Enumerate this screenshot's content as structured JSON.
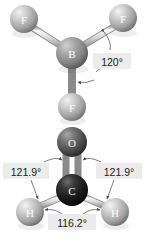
{
  "figure": {
    "background_color": "#ffffff",
    "type": "ball-and-stick molecular geometry diagram"
  },
  "molecules": [
    {
      "name": "boron-trifluoride",
      "formula": "BF3",
      "geometry": "trigonal planar",
      "atoms": [
        {
          "element": "F",
          "label": "F",
          "cx": 24,
          "cy": 19,
          "r": 14,
          "color": "#b9b9b9",
          "highlight": "#efefef"
        },
        {
          "element": "F",
          "label": "F",
          "cx": 123,
          "cy": 18,
          "r": 14,
          "color": "#b9b9b9",
          "highlight": "#efefef"
        },
        {
          "element": "B",
          "label": "B",
          "cx": 72,
          "cy": 53,
          "r": 16,
          "color": "#8f8f8f",
          "highlight": "#d8d8d8"
        },
        {
          "element": "F",
          "label": "F",
          "cx": 72,
          "cy": 107,
          "r": 14,
          "color": "#b0b0b0",
          "highlight": "#e8e8e8"
        }
      ],
      "bonds": [
        {
          "from": "B",
          "to": "F-left",
          "order": 1
        },
        {
          "from": "B",
          "to": "F-right",
          "order": 1
        },
        {
          "from": "B",
          "to": "F-bottom",
          "order": 1
        }
      ],
      "angle_labels": [
        {
          "value": "120°",
          "x": 112,
          "y": 62,
          "describes": "F-B-F bond angle"
        }
      ]
    },
    {
      "name": "formaldehyde",
      "formula": "H2CO",
      "geometry": "trigonal planar",
      "atoms": [
        {
          "element": "O",
          "label": "O",
          "cx": 72,
          "cy": 142,
          "r": 15,
          "color": "#585858",
          "highlight": "#a6a6a6"
        },
        {
          "element": "C",
          "label": "C",
          "cx": 72,
          "cy": 190,
          "r": 16,
          "color": "#1d1d1d",
          "highlight": "#6a6a6a"
        },
        {
          "element": "H",
          "label": "H",
          "cx": 30,
          "cy": 212,
          "r": 14,
          "color": "#b6b6b6",
          "highlight": "#efefef"
        },
        {
          "element": "H",
          "label": "H",
          "cx": 115,
          "cy": 212,
          "r": 14,
          "color": "#b6b6b6",
          "highlight": "#efefef"
        }
      ],
      "bonds": [
        {
          "from": "C",
          "to": "O",
          "order": 2
        },
        {
          "from": "C",
          "to": "H-left",
          "order": 1
        },
        {
          "from": "C",
          "to": "H-right",
          "order": 1
        }
      ],
      "angle_labels": [
        {
          "value": "121.9°",
          "x": 26,
          "y": 171,
          "describes": "H-C-O bond angle left"
        },
        {
          "value": "121.9°",
          "x": 119,
          "y": 171,
          "describes": "H-C-O bond angle right"
        },
        {
          "value": "116.2°",
          "x": 72,
          "y": 222,
          "describes": "H-C-H bond angle"
        }
      ]
    }
  ]
}
